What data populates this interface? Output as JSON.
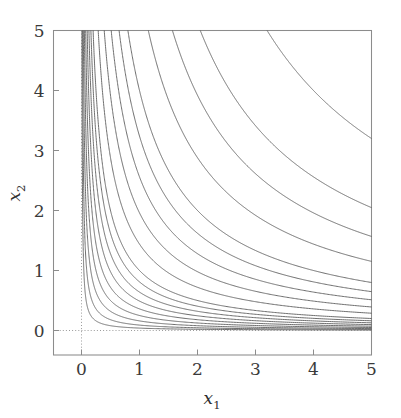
{
  "figure": {
    "kind": "contour-plot",
    "background_color": "#ffffff",
    "frame_color": "#8c8c8c",
    "contour_color": "#6e6e6e",
    "guide_color": "#9a9a9a",
    "text_color": "#3a3a3a"
  },
  "axes": {
    "x_label_main": "x",
    "x_label_sub": "1",
    "y_label_main": "x",
    "y_label_sub": "2",
    "x_ticks": [
      "0",
      "1",
      "2",
      "3",
      "4",
      "5"
    ],
    "y_ticks": [
      "0",
      "1",
      "2",
      "3",
      "4",
      "5"
    ]
  },
  "chart_data": {
    "type": "line",
    "title": "",
    "subtitle": "",
    "xlabel": "x_1",
    "ylabel": "x_2",
    "xlim": [
      -0.5,
      5.0
    ],
    "ylim": [
      -0.45,
      5.0
    ],
    "x_ticks": [
      0,
      1,
      2,
      3,
      4,
      5
    ],
    "y_ticks": [
      0,
      1,
      2,
      3,
      4,
      5
    ],
    "grid": false,
    "legend": null,
    "contour_function": "x1 * x2",
    "contour_levels": [
      0.04,
      0.09,
      0.16,
      0.25,
      0.36,
      0.49,
      0.64,
      0.81,
      1.0,
      1.44,
      1.96,
      2.56,
      3.24,
      4.0,
      5.76,
      7.84,
      10.24,
      16.0
    ],
    "reference_lines": [
      {
        "name": "x1-zero",
        "orientation": "vertical",
        "value": 0,
        "style": "dotted"
      },
      {
        "name": "x2-zero",
        "orientation": "horizontal",
        "value": 0,
        "style": "dotted"
      }
    ],
    "series": [
      {
        "name": "c=0.04",
        "value": 0.04
      },
      {
        "name": "c=0.09",
        "value": 0.09
      },
      {
        "name": "c=0.16",
        "value": 0.16
      },
      {
        "name": "c=0.25",
        "value": 0.25
      },
      {
        "name": "c=0.36",
        "value": 0.36
      },
      {
        "name": "c=0.49",
        "value": 0.49
      },
      {
        "name": "c=0.64",
        "value": 0.64
      },
      {
        "name": "c=0.81",
        "value": 0.81
      },
      {
        "name": "c=1.00",
        "value": 1.0
      },
      {
        "name": "c=1.44",
        "value": 1.44
      },
      {
        "name": "c=1.96",
        "value": 1.96
      },
      {
        "name": "c=2.56",
        "value": 2.56
      },
      {
        "name": "c=3.24",
        "value": 3.24
      },
      {
        "name": "c=4.00",
        "value": 4.0
      },
      {
        "name": "c=5.76",
        "value": 5.76
      },
      {
        "name": "c=7.84",
        "value": 7.84
      },
      {
        "name": "c=10.24",
        "value": 10.24
      },
      {
        "name": "c=16.00",
        "value": 16.0
      }
    ]
  }
}
